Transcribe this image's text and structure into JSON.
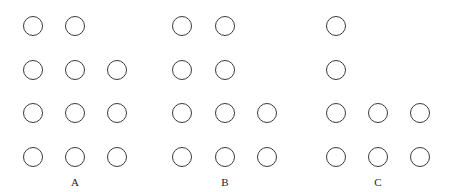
{
  "figure": {
    "panels": [
      {
        "label": "A",
        "label_x": 75,
        "columns_x": [
          33,
          75,
          117
        ],
        "rows_counts": [
          2,
          3,
          3,
          3
        ]
      },
      {
        "label": "B",
        "label_x": 225,
        "columns_x": [
          182,
          225,
          267
        ],
        "rows_counts": [
          2,
          2,
          3,
          3
        ]
      },
      {
        "label": "C",
        "label_x": 378,
        "columns_x": [
          336,
          378,
          420
        ],
        "rows_counts": [
          1,
          1,
          3,
          3
        ]
      }
    ],
    "rows_y": [
      26,
      70,
      113,
      157
    ],
    "label_y": 176,
    "circle_stroke_color": "#3a3a3a"
  }
}
